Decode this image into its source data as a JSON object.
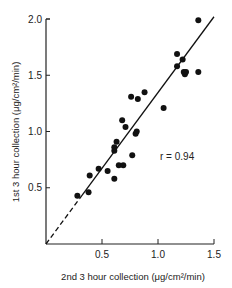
{
  "chart_data": {
    "type": "scatter",
    "title": "",
    "xlabel": "2nd 3 hour collection (μg/cm²/min)",
    "ylabel": "1st 3 hour collection (μg/cm²/min)",
    "xlim": [
      0,
      1.5
    ],
    "ylim": [
      0,
      2.0
    ],
    "xticks": [
      0.5,
      1.0,
      1.5
    ],
    "yticks": [
      0.5,
      1.0,
      1.5,
      2.0
    ],
    "xtick_labels": [
      "0.5",
      "1.0",
      "1.5"
    ],
    "ytick_labels": [
      "0.5",
      "1.0",
      "1.5",
      "2.0"
    ],
    "grid": false,
    "annotation": "r = 0.94",
    "regression_line": {
      "from": [
        0,
        0
      ],
      "to": [
        1.5,
        2.02
      ],
      "dashed_until_x": 0.3
    },
    "points": [
      [
        1.36,
        1.99
      ],
      [
        1.17,
        1.69
      ],
      [
        1.22,
        1.64
      ],
      [
        1.17,
        1.58
      ],
      [
        1.23,
        1.53
      ],
      [
        1.24,
        1.51
      ],
      [
        1.25,
        1.53
      ],
      [
        1.36,
        1.53
      ],
      [
        0.88,
        1.35
      ],
      [
        0.76,
        1.31
      ],
      [
        0.82,
        1.29
      ],
      [
        1.05,
        1.21
      ],
      [
        0.68,
        1.1
      ],
      [
        0.71,
        1.04
      ],
      [
        0.81,
        1.0
      ],
      [
        0.8,
        0.98
      ],
      [
        0.63,
        0.91
      ],
      [
        0.61,
        0.86
      ],
      [
        0.61,
        0.83
      ],
      [
        0.77,
        0.79
      ],
      [
        0.65,
        0.7
      ],
      [
        0.69,
        0.7
      ],
      [
        0.47,
        0.67
      ],
      [
        0.55,
        0.65
      ],
      [
        0.39,
        0.61
      ],
      [
        0.61,
        0.58
      ],
      [
        0.38,
        0.46
      ],
      [
        0.28,
        0.43
      ]
    ]
  }
}
